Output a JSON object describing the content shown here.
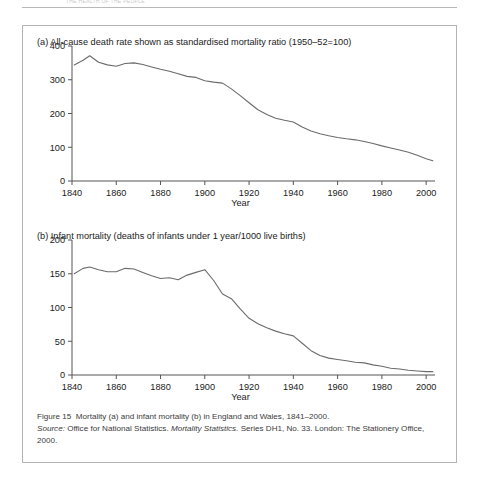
{
  "running_head": {
    "text": "THE HEALTH OF THE PEOPLE"
  },
  "figure": {
    "panel_a": {
      "label": "(a)",
      "title": "(a) All-cause death rate shown as standardised mortality ratio (1950–52=100)"
    },
    "panel_b": {
      "label": "(b)",
      "title": "(b) Infant mortality (deaths of infants under 1 year/1000 live births)"
    },
    "xaxis_label": "Year",
    "caption": {
      "line1_prefix": "Figure 15",
      "line1_rest": "Mortality (a) and infant mortality (b) in England and Wales, 1841–2000.",
      "source_label": "Source:",
      "source_text_1": "Office for National Statistics.",
      "source_italic": "Mortality Statistics.",
      "source_text_2": "Series DH1, No. 33. London: The Stationery Office, 2000."
    }
  },
  "chart_data": [
    {
      "type": "line",
      "id": "panel-a",
      "title": "(a) All-cause death rate shown as standardised mortality ratio (1950–52=100)",
      "xlabel": "Year",
      "ylabel": "",
      "xlim": [
        1840,
        2004
      ],
      "ylim": [
        0,
        400
      ],
      "xticks": [
        1840,
        1860,
        1880,
        1900,
        1920,
        1940,
        1960,
        1980,
        2000
      ],
      "yticks": [
        0,
        100,
        200,
        300,
        400
      ],
      "grid": false,
      "legend": "none",
      "series": [
        {
          "name": "All-cause standardised mortality ratio",
          "x": [
            1841,
            1845,
            1848,
            1852,
            1856,
            1860,
            1864,
            1868,
            1872,
            1876,
            1880,
            1884,
            1888,
            1892,
            1896,
            1900,
            1904,
            1908,
            1912,
            1916,
            1920,
            1924,
            1928,
            1932,
            1936,
            1940,
            1944,
            1948,
            1952,
            1956,
            1960,
            1964,
            1968,
            1972,
            1976,
            1980,
            1984,
            1988,
            1992,
            1996,
            2000,
            2003
          ],
          "values": [
            344,
            358,
            371,
            352,
            344,
            340,
            348,
            350,
            345,
            338,
            331,
            325,
            318,
            310,
            307,
            297,
            293,
            290,
            273,
            253,
            232,
            211,
            197,
            186,
            180,
            175,
            160,
            148,
            140,
            134,
            129,
            125,
            122,
            117,
            111,
            104,
            98,
            92,
            85,
            76,
            66,
            60
          ]
        }
      ]
    },
    {
      "type": "line",
      "id": "panel-b",
      "title": "(b) Infant mortality (deaths of infants under 1 year/1000 live births)",
      "xlabel": "Year",
      "ylabel": "",
      "xlim": [
        1840,
        2004
      ],
      "ylim": [
        0,
        200
      ],
      "xticks": [
        1840,
        1860,
        1880,
        1900,
        1920,
        1940,
        1960,
        1980,
        2000
      ],
      "yticks": [
        0,
        50,
        100,
        150,
        200
      ],
      "grid": false,
      "legend": "none",
      "series": [
        {
          "name": "Infant mortality per 1000 live births",
          "x": [
            1841,
            1845,
            1848,
            1852,
            1856,
            1860,
            1864,
            1868,
            1872,
            1876,
            1880,
            1884,
            1888,
            1892,
            1896,
            1900,
            1904,
            1908,
            1912,
            1916,
            1920,
            1924,
            1928,
            1932,
            1936,
            1940,
            1944,
            1948,
            1952,
            1956,
            1960,
            1964,
            1968,
            1972,
            1976,
            1980,
            1984,
            1988,
            1992,
            1996,
            2000,
            2003
          ],
          "values": [
            150,
            158,
            160,
            156,
            153,
            153,
            158,
            157,
            152,
            147,
            143,
            144,
            141,
            148,
            152,
            156,
            140,
            120,
            113,
            98,
            84,
            76,
            70,
            65,
            61,
            58,
            47,
            36,
            29,
            25,
            23,
            21,
            19,
            18,
            15,
            13,
            10,
            9,
            7,
            6,
            5,
            5
          ]
        }
      ]
    }
  ]
}
